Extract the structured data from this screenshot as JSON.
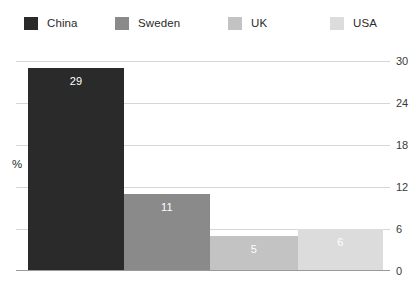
{
  "chart_data": {
    "type": "bar",
    "title": "",
    "subtitle": "",
    "xlabel": "",
    "ylabel": "%",
    "categories": [
      "China",
      "Sweden",
      "UK",
      "USA"
    ],
    "values": [
      29,
      11,
      5,
      6
    ],
    "value_labels": [
      "29",
      "11",
      "5",
      "6"
    ],
    "ylim": [
      0,
      30
    ],
    "yticks": [
      0,
      6,
      12,
      18,
      24,
      30
    ],
    "ytick_labels": [
      "0",
      "6",
      "12",
      "18",
      "24",
      "30"
    ],
    "ytick_position": "right",
    "grid": true,
    "grid_axis": "y",
    "legend": {
      "position": "top",
      "entries": [
        {
          "label": "China",
          "color": "#2b2a2a"
        },
        {
          "label": "Sweden",
          "color": "#8a8a8a"
        },
        {
          "label": "UK",
          "color": "#c3c3c3"
        },
        {
          "label": "USA",
          "color": "#dcdcdc"
        }
      ]
    },
    "series": [
      {
        "name": "share",
        "points": [
          {
            "category": "China",
            "value": 29,
            "label": "29",
            "color": "#2b2a2a"
          },
          {
            "category": "Sweden",
            "value": 11,
            "label": "11",
            "color": "#8a8a8a"
          },
          {
            "category": "UK",
            "value": 5,
            "label": "5",
            "color": "#c3c3c3"
          },
          {
            "category": "USA",
            "value": 6,
            "label": "6",
            "color": "#dcdcdc"
          }
        ]
      }
    ],
    "colors": {
      "grid": "#d6d6d6",
      "axis": "#9a9a9a",
      "tick_text": "#3a3a3a",
      "value_text": "#ffffff",
      "background": "#ffffff"
    }
  },
  "legend": {
    "items": [
      {
        "label": "China",
        "color": "#2b2a2a",
        "left": 24
      },
      {
        "label": "Sweden",
        "color": "#8a8a8a",
        "left": 115
      },
      {
        "label": "UK",
        "color": "#c3c3c3",
        "left": 228
      },
      {
        "label": "USA",
        "color": "#dcdcdc",
        "left": 330
      }
    ]
  },
  "axis": {
    "y_title": "%",
    "ticks": [
      "0",
      "6",
      "12",
      "18",
      "24",
      "30"
    ]
  },
  "bars": [
    {
      "label": "China",
      "value": "29",
      "color": "#2b2a2a",
      "left": 12,
      "width": 96
    },
    {
      "label": "Sweden",
      "value": "11",
      "color": "#8a8a8a",
      "left": 108,
      "width": 86
    },
    {
      "label": "UK",
      "value": "5",
      "color": "#c3c3c3",
      "left": 194,
      "width": 88
    },
    {
      "label": "USA",
      "value": "6",
      "color": "#dcdcdc",
      "left": 282,
      "width": 85
    }
  ]
}
